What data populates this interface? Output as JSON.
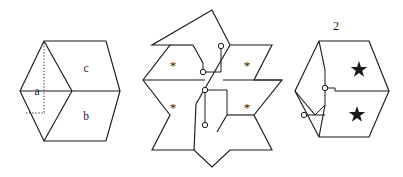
{
  "figures": [
    {
      "id": "hexagon-abc",
      "name": "hexagon-with-three-rhombi",
      "caption": "",
      "region_labels": [
        "a",
        "c",
        "b"
      ],
      "label_a": "a",
      "label_b": "b",
      "label_c": "c",
      "dashed_marks": 2,
      "outline": "hexagon",
      "internal_edges": 3,
      "stroke_color": "#1a1a1a",
      "fill_color": "#ffffff"
    },
    {
      "id": "star",
      "name": "star-of-david-tiling",
      "caption": "",
      "marker_glyph": "*",
      "marker_count": 4,
      "markers": [
        "*",
        "*",
        "*",
        "*"
      ],
      "node_count": 4,
      "outline": "hexagram",
      "stroke_color": "#1a1a1a",
      "fill_color": "#ffffff"
    },
    {
      "id": "hexagon-2",
      "name": "hexagon-labeled-two",
      "caption": "2",
      "marker_glyph": "star",
      "marker_count": 2,
      "markers": [
        "★",
        "★"
      ],
      "node_count": 2,
      "outline": "hexagon",
      "stroke_color": "#1a1a1a",
      "fill_color": "#ffffff"
    }
  ],
  "page": {
    "background_color": "#ffffff",
    "ink_color": "#1a1a1a"
  }
}
